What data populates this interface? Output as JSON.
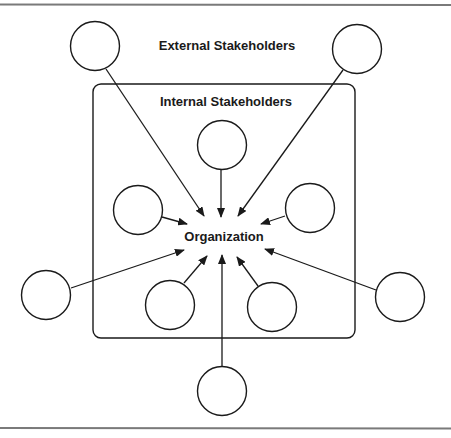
{
  "diagram": {
    "labels": {
      "external": "External Stakeholders",
      "internal": "Internal Stakeholders",
      "center": "Organization"
    },
    "colors": {
      "stroke": "#1a1a1a",
      "rule": "#7a7a7a",
      "background": "#ffffff"
    },
    "external_stakeholders": [
      {
        "id": "ext-top-left",
        "cx": 95,
        "cy": 46
      },
      {
        "id": "ext-top-right",
        "cx": 357,
        "cy": 49
      },
      {
        "id": "ext-left",
        "cx": 46,
        "cy": 295
      },
      {
        "id": "ext-right",
        "cx": 400,
        "cy": 297
      },
      {
        "id": "ext-bottom",
        "cx": 222,
        "cy": 391
      }
    ],
    "internal_stakeholders": [
      {
        "id": "int-top",
        "cx": 222,
        "cy": 145
      },
      {
        "id": "int-left",
        "cx": 138,
        "cy": 210
      },
      {
        "id": "int-right",
        "cx": 310,
        "cy": 208
      },
      {
        "id": "int-bottom-left",
        "cx": 170,
        "cy": 305
      },
      {
        "id": "int-bottom-right",
        "cx": 272,
        "cy": 307
      }
    ],
    "arrows": [
      {
        "from": "ext-top-left",
        "x1": 106,
        "y1": 69,
        "x2": 204,
        "y2": 216
      },
      {
        "from": "ext-top-right",
        "x1": 343,
        "y1": 70,
        "x2": 238,
        "y2": 216
      },
      {
        "from": "int-top",
        "x1": 221,
        "y1": 169,
        "x2": 221,
        "y2": 217
      },
      {
        "from": "int-left",
        "x1": 162,
        "y1": 217,
        "x2": 187,
        "y2": 224
      },
      {
        "from": "int-right",
        "x1": 285,
        "y1": 216,
        "x2": 261,
        "y2": 224
      },
      {
        "from": "ext-left",
        "x1": 71,
        "y1": 288,
        "x2": 184,
        "y2": 250
      },
      {
        "from": "ext-right",
        "x1": 376,
        "y1": 290,
        "x2": 265,
        "y2": 249
      },
      {
        "from": "int-bottom-left",
        "x1": 184,
        "y1": 283,
        "x2": 207,
        "y2": 256
      },
      {
        "from": "int-bottom-right",
        "x1": 258,
        "y1": 286,
        "x2": 237,
        "y2": 257
      },
      {
        "from": "ext-bottom",
        "x1": 222,
        "y1": 367,
        "x2": 222,
        "y2": 255
      }
    ]
  }
}
